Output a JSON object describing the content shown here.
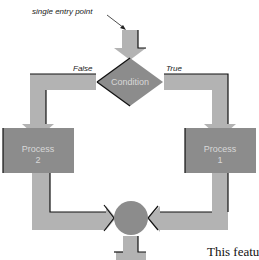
{
  "diagram": {
    "entry_label": "single entry point",
    "condition_label": "Condition",
    "false_label": "False",
    "true_label": "True",
    "process_left": {
      "line1": "Process",
      "line2": "2"
    },
    "process_right": {
      "line1": "Process",
      "line2": "1"
    },
    "caption_fragment": "This featu"
  },
  "colors": {
    "arrow_fill": "#b3b3b3",
    "shape_fill": "#8c8c8c",
    "outline": "#111111",
    "text_inside": "#d8d8d8"
  }
}
